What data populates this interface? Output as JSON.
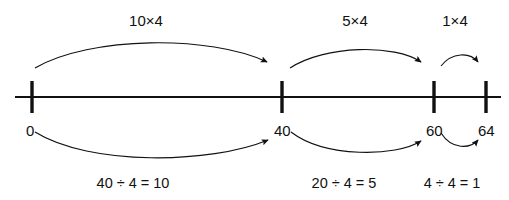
{
  "diagram": {
    "colors": {
      "line": "#111111",
      "arrow": "#1a1a1a",
      "text": "#111111",
      "background": "#ffffff"
    },
    "number_line": {
      "start_x": 15,
      "end_x": 501,
      "y": 97,
      "ticks": [
        {
          "value": "0",
          "x": 32
        },
        {
          "value": "40",
          "x": 282
        },
        {
          "value": "60",
          "x": 434
        },
        {
          "value": "64",
          "x": 486
        }
      ]
    },
    "top_labels": [
      {
        "text": "10×4",
        "x": 146,
        "y": 13
      },
      {
        "text": "5×4",
        "x": 355,
        "y": 13
      },
      {
        "text": "1×4",
        "x": 455,
        "y": 13
      }
    ],
    "tick_labels": [
      {
        "text": "0",
        "x": 26,
        "y": 123
      },
      {
        "text": "40",
        "x": 274,
        "y": 123
      },
      {
        "text": "60",
        "x": 426,
        "y": 123
      },
      {
        "text": "64",
        "x": 478,
        "y": 123
      }
    ],
    "bottom_labels": [
      {
        "text": "40 ÷ 4 = 10",
        "x": 133,
        "y": 176
      },
      {
        "text": "20 ÷ 4 = 5",
        "x": 344,
        "y": 176
      },
      {
        "text": "4 ÷ 4 = 1",
        "x": 452,
        "y": 176
      }
    ],
    "top_arrows": [
      {
        "name": "arrow-0-to-40",
        "path": "M 35,68 C 90,36 210,35 267,62"
      },
      {
        "name": "arrow-40-to-60",
        "path": "M 290,68 C 325,45 395,44 421,62"
      },
      {
        "name": "arrow-60-to-64",
        "path": "M 441,66 C 452,52 470,52 478,62"
      }
    ],
    "bottom_arrows": [
      {
        "name": "arrow-0-to-40-lower",
        "path": "M 35,132 C 90,166 210,164 268,140"
      },
      {
        "name": "arrow-40-to-60-lower",
        "path": "M 291,132 C 325,158 396,157 421,141"
      },
      {
        "name": "arrow-60-to-64-lower",
        "path": "M 441,133 C 452,150 470,149 478,140"
      }
    ]
  }
}
